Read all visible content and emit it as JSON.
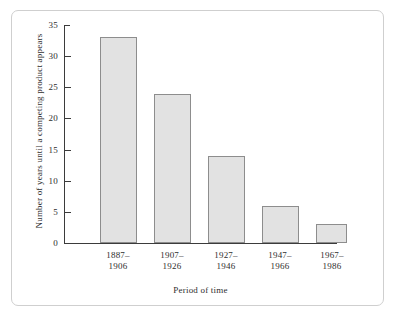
{
  "chart_data": {
    "type": "bar",
    "title": "",
    "xlabel": "Period of time",
    "ylabel": "Number of years until a competing product appears",
    "categories": [
      "1887–1906",
      "1907–1926",
      "1927–1946",
      "1947–1966",
      "1967–1986"
    ],
    "categories_lines": [
      [
        "1887–",
        "1906"
      ],
      [
        "1907–",
        "1926"
      ],
      [
        "1927–",
        "1946"
      ],
      [
        "1947–",
        "1966"
      ],
      [
        "1967–",
        "1986"
      ]
    ],
    "values": [
      33,
      24,
      14,
      6,
      3
    ],
    "ylim": [
      0,
      35
    ],
    "yticks": [
      0,
      5,
      10,
      15,
      20,
      25,
      30,
      35
    ],
    "ytick_labels": [
      "0",
      "5",
      "10",
      "15",
      "20",
      "25",
      "30",
      "35"
    ],
    "grid": false,
    "legend": null,
    "bar_fill_color": "#e2e2e2",
    "bar_edge_color": "#8d8d8d",
    "axis_color": "#3b3b3b",
    "frame_color": "#cfcfcf",
    "background_color": "#ffffff"
  }
}
